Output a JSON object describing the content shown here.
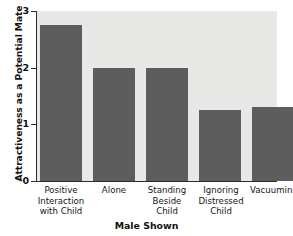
{
  "chart_data": {
    "type": "bar",
    "title": "",
    "xlabel": "Male Shown",
    "ylabel": "Attractiveness as a Potential Mate",
    "categories": [
      "Positive Interaction with Child",
      "Alone",
      "Standing Beside Child",
      "Ignoring Distressed Child",
      "Vacuuming"
    ],
    "category_lines": [
      [
        "Positive",
        "Interaction",
        "with Child"
      ],
      [
        "Alone"
      ],
      [
        "Standing",
        "Beside",
        "Child"
      ],
      [
        "Ignoring",
        "Distressed",
        "Child"
      ],
      [
        "Vacuuming"
      ]
    ],
    "values": [
      2.75,
      2.0,
      2.0,
      1.25,
      1.3
    ],
    "ylim": [
      0,
      3
    ],
    "yticks": [
      0,
      1,
      2,
      3
    ],
    "ytick_labels": [
      "0",
      "1",
      "2",
      "3"
    ],
    "grid": false,
    "legend": null,
    "bar_color": "#5d5d5d",
    "plot_background": "#e8e8e6",
    "axis_color": "#2b2b2b"
  }
}
